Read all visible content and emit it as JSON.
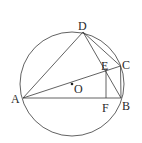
{
  "diagram": {
    "type": "geometry",
    "circle": {
      "center": "O",
      "cx": 72,
      "cy": 84,
      "r": 52
    },
    "points": {
      "A": {
        "label": "A",
        "x": 23,
        "y": 98
      },
      "B": {
        "label": "B",
        "x": 121,
        "y": 98
      },
      "C": {
        "label": "C",
        "x": 120.5,
        "y": 66
      },
      "D": {
        "label": "D",
        "x": 83,
        "y": 32
      },
      "E": {
        "label": "E",
        "x": 106,
        "y": 68
      },
      "F": {
        "label": "F",
        "x": 106,
        "y": 98
      },
      "O": {
        "label": "O",
        "x": 72,
        "y": 84
      }
    },
    "segments": [
      "AB",
      "AD",
      "AC",
      "DB",
      "DC",
      "CB",
      "EF"
    ],
    "colors": {
      "stroke": "#3a3a3a",
      "text": "#2a2a2a",
      "background": "#ffffff"
    }
  }
}
